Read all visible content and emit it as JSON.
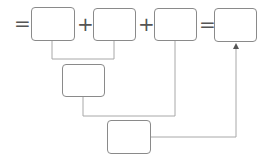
{
  "diagram": {
    "operators": {
      "leading_equals": "=",
      "plus_1": "+",
      "plus_2": "+",
      "equals": "="
    },
    "boxes": [
      {
        "id": "box-1",
        "value": ""
      },
      {
        "id": "box-2",
        "value": ""
      },
      {
        "id": "box-3",
        "value": ""
      },
      {
        "id": "box-result",
        "value": ""
      },
      {
        "id": "box-sum-1-2",
        "value": ""
      },
      {
        "id": "box-total",
        "value": ""
      }
    ],
    "colors": {
      "box_border": "#8a8a8a",
      "connector": "#a8a8a8",
      "operator": "#555555"
    }
  }
}
